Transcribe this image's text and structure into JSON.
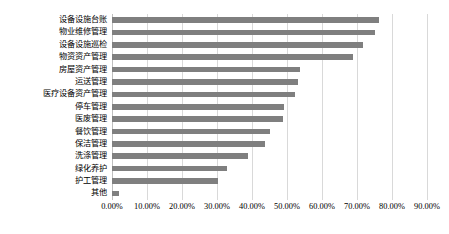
{
  "chart_data": {
    "type": "bar",
    "orientation": "horizontal",
    "title": "",
    "xlabel": "",
    "ylabel": "",
    "grid": true,
    "legend": false,
    "xlim": [
      0,
      0.9
    ],
    "xticks": [
      "0.00%",
      "10.00%",
      "20.00%",
      "30.00%",
      "40.00%",
      "50.00%",
      "60.00%",
      "70.00%",
      "80.00%",
      "90.00%"
    ],
    "xtick_values": [
      0,
      10,
      20,
      30,
      40,
      50,
      60,
      70,
      80,
      90
    ],
    "bar_color": "#7f7f7f",
    "gridline_color": "#d9d9d9",
    "categories": [
      "其他",
      "护工管理",
      "绿化养护",
      "洗涤管理",
      "保洁管理",
      "餐饮管理",
      "医废管理",
      "停车管理",
      "医疗设备资产管理",
      "运送管理",
      "房屋资产管理",
      "物资资产管理",
      "设备设施巡检",
      "物业维修管理",
      "设备设施台账"
    ],
    "values": [
      2.0,
      30.3,
      32.9,
      38.9,
      43.7,
      45.1,
      48.9,
      49.1,
      52.3,
      53.1,
      53.7,
      68.9,
      71.7,
      75.1,
      76.3
    ],
    "value_labels": [
      "2.00%",
      "30.30%",
      "32.90%",
      "38.90%",
      "43.70%",
      "45.10%",
      "48.90%",
      "49.10%",
      "52.30%",
      "53.10%",
      "53.70%",
      "68.90%",
      "71.70%",
      "75.10%",
      "76.30%"
    ]
  }
}
